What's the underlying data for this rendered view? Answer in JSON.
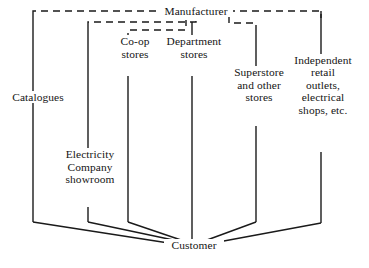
{
  "diagram": {
    "background_color": "#ffffff",
    "line_color": "#1a1a1a",
    "text_color": "#141414",
    "nodes": [
      {
        "id": "manufacturer",
        "label": "Manufacturer",
        "lines": [
          "Manufacturer"
        ],
        "x": 196,
        "y": 11,
        "width": 74,
        "align": "center"
      },
      {
        "id": "catalogues",
        "label": "Catalogues",
        "lines": [
          "Catalogues"
        ],
        "x": 38,
        "y": 97,
        "width": 70,
        "align": "center"
      },
      {
        "id": "coop-stores",
        "label": "Co-op stores",
        "lines": [
          "Co-op",
          "stores"
        ],
        "x": 135,
        "y": 48,
        "width": 46,
        "align": "center"
      },
      {
        "id": "department-stores",
        "label": "Department stores",
        "lines": [
          "Department",
          "stores"
        ],
        "x": 194,
        "y": 48,
        "width": 68,
        "align": "center"
      },
      {
        "id": "superstore",
        "label": "Superstore and other stores",
        "lines": [
          "Superstore",
          "and other",
          "stores"
        ],
        "x": 259,
        "y": 85,
        "width": 64,
        "align": "center"
      },
      {
        "id": "independent-retail",
        "label": "Independent retail outlets, electrical shops, etc.",
        "lines": [
          "Independent",
          "retail",
          "outlets,",
          "electrical",
          "shops, etc."
        ],
        "x": 323,
        "y": 85,
        "width": 72,
        "align": "center"
      },
      {
        "id": "electricity-showroom",
        "label": "Electricity Company showroom",
        "lines": [
          "Electricity",
          "Company",
          "showroom"
        ],
        "x": 90,
        "y": 167,
        "width": 74,
        "align": "center"
      },
      {
        "id": "customer",
        "label": "Customer",
        "lines": [
          "Customer"
        ],
        "x": 194,
        "y": 245,
        "width": 60,
        "align": "center"
      }
    ],
    "connectors": {
      "dashed": [
        {
          "id": "manufacturer-to-catalogues",
          "from": "manufacturer",
          "to": "catalogues",
          "points": "33,15 33,11 163,11",
          "style": "dashed"
        },
        {
          "id": "manufacturer-to-electricity-showroom",
          "from": "manufacturer",
          "to": "electricity-showroom",
          "points": "88,28 88,22 196,22 196,16",
          "style": "dashed"
        },
        {
          "id": "manufacturer-to-coop",
          "from": "manufacturer",
          "to": "coop-stores",
          "points": "128,40 128,30 186,30 186,20",
          "style": "dashed"
        },
        {
          "id": "manufacturer-to-independent",
          "from": "manufacturer",
          "to": "independent-retail",
          "points": "228,11 321,11 321,18",
          "style": "dashed"
        },
        {
          "id": "manufacturer-to-superstore",
          "from": "manufacturer",
          "to": "superstore",
          "points": "229,16 229,23 256,23 256,31",
          "style": "dashed"
        }
      ],
      "solid": [
        {
          "id": "catalogues-trunk",
          "points": "33,15 33,222",
          "style": "solid"
        },
        {
          "id": "catalogues-to-customer",
          "from": "catalogues",
          "to": "customer",
          "points": "33,222 175,244",
          "style": "solid"
        },
        {
          "id": "electricity-trunk-upper",
          "points": "88,28 88,160",
          "style": "solid"
        },
        {
          "id": "electricity-trunk-lower",
          "points": "88,207 88,222",
          "style": "solid"
        },
        {
          "id": "electricity-to-customer",
          "from": "electricity-showroom",
          "to": "customer",
          "points": "88,222 178,241",
          "style": "solid"
        },
        {
          "id": "coop-trunk-upper",
          "points": "128,40 128,46",
          "style": "solid"
        },
        {
          "id": "coop-trunk-lower",
          "points": "128,76 128,222",
          "style": "solid"
        },
        {
          "id": "coop-to-customer",
          "from": "coop-stores",
          "to": "customer",
          "points": "128,222 181,240",
          "style": "solid"
        },
        {
          "id": "department-trunk-upper",
          "points": "192,22 192,46",
          "style": "solid"
        },
        {
          "id": "department-trunk-lower",
          "points": "192,76 192,240",
          "style": "solid"
        },
        {
          "id": "superstore-trunk-upper",
          "points": "256,31 256,83",
          "style": "solid"
        },
        {
          "id": "superstore-trunk-lower",
          "points": "256,126 256,222",
          "style": "solid"
        },
        {
          "id": "superstore-to-customer",
          "from": "superstore",
          "to": "customer",
          "points": "256,222 207,240",
          "style": "solid"
        },
        {
          "id": "independent-trunk-upper",
          "points": "321,11 321,83",
          "style": "solid"
        },
        {
          "id": "independent-trunk-lower",
          "points": "321,152 321,223",
          "style": "solid"
        },
        {
          "id": "independent-to-customer",
          "from": "independent-retail",
          "to": "customer",
          "points": "321,223 213,243",
          "style": "solid"
        }
      ]
    }
  }
}
